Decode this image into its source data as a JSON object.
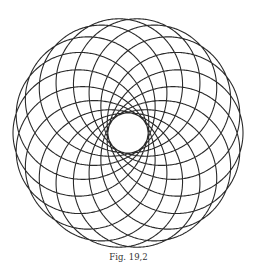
{
  "figure": {
    "caption": "Fig. 19,2",
    "curve": {
      "type": "hypotrochoid-rosette",
      "lobes": 18,
      "center": [
        128,
        133
      ],
      "outer_radius": 115,
      "inner_radius": 20,
      "tip_angle_offset_deg": 10,
      "stroke_color": "#2a2a2a",
      "stroke_width": 1.1
    },
    "background_color": "#ffffff"
  }
}
